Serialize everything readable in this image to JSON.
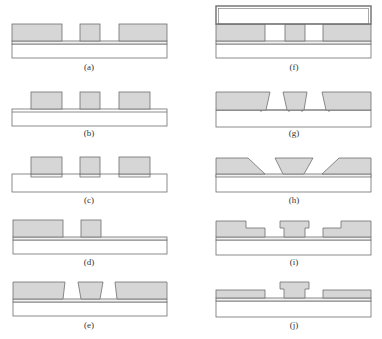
{
  "figure": {
    "colors": {
      "resist_fill": "#d6d6d6",
      "outline": "#6e6e6e",
      "substrate_fill": "#ffffff",
      "layer_fill": "#f2f2f2"
    },
    "panels": [
      {
        "id": "a",
        "label": "(a)"
      },
      {
        "id": "b",
        "label": "(b)"
      },
      {
        "id": "c",
        "label": "(c)"
      },
      {
        "id": "d",
        "label": "(d)"
      },
      {
        "id": "e",
        "label": "(e)"
      },
      {
        "id": "f",
        "label": "(f)"
      },
      {
        "id": "g",
        "label": "(g)"
      },
      {
        "id": "h",
        "label": "(h)"
      },
      {
        "id": "i",
        "label": "(i)"
      },
      {
        "id": "j",
        "label": "(j)"
      }
    ]
  }
}
